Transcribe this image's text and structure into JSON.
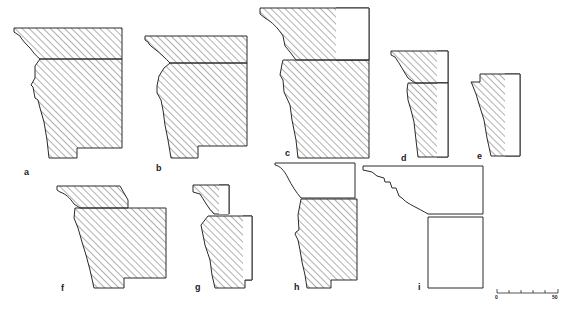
{
  "figure": {
    "type": "architectural moulding profiles (cornice sections)",
    "colors": {
      "line": "#2a2a2a",
      "hatch": "#3a3a3a",
      "background": "#ffffff"
    },
    "profiles": [
      {
        "id": "a",
        "label": "a",
        "hatched": true,
        "two_blocks": true
      },
      {
        "id": "b",
        "label": "b",
        "hatched": true,
        "two_blocks": true
      },
      {
        "id": "c",
        "label": "c",
        "hatched": true,
        "two_blocks": true
      },
      {
        "id": "d",
        "label": "d",
        "hatched": true,
        "two_blocks": true
      },
      {
        "id": "e",
        "label": "e",
        "hatched": true,
        "two_blocks": false
      },
      {
        "id": "f",
        "label": "f",
        "hatched": true,
        "two_blocks": true
      },
      {
        "id": "g",
        "label": "g",
        "hatched": true,
        "two_blocks": true
      },
      {
        "id": "h",
        "label": "h",
        "hatched": "lower block only",
        "two_blocks": true
      },
      {
        "id": "i",
        "label": "i",
        "hatched": false,
        "two_blocks": true
      }
    ],
    "scale_bar": {
      "start_label": "0",
      "end_label": "50",
      "ticks": 6
    }
  }
}
